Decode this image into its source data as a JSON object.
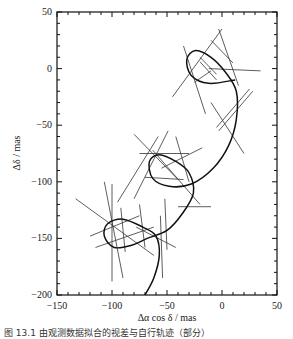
{
  "chart_data": {
    "type": "line",
    "title": "",
    "xlabel": "Δα cos δ / mas",
    "ylabel": "Δδ / mas",
    "xlim": [
      -150,
      50
    ],
    "ylim": [
      -200,
      50
    ],
    "xticks": [
      -150,
      -100,
      -50,
      0,
      50
    ],
    "yticks": [
      50,
      0,
      -50,
      -100,
      -150,
      -200
    ],
    "grid": false,
    "legend": null,
    "series": [
      {
        "name": "astrometric orbit (parallax + proper motion)",
        "style": "curve",
        "points": [
          [
            -70,
            -205
          ],
          [
            -62,
            -185
          ],
          [
            -57,
            -165
          ],
          [
            -60,
            -148
          ],
          [
            -72,
            -140
          ],
          [
            -90,
            -133
          ],
          [
            -104,
            -137
          ],
          [
            -107,
            -148
          ],
          [
            -98,
            -158
          ],
          [
            -82,
            -156
          ],
          [
            -68,
            -150
          ],
          [
            -50,
            -143
          ],
          [
            -36,
            -128
          ],
          [
            -26,
            -110
          ],
          [
            -30,
            -92
          ],
          [
            -42,
            -82
          ],
          [
            -57,
            -76
          ],
          [
            -66,
            -82
          ],
          [
            -63,
            -97
          ],
          [
            -48,
            -104
          ],
          [
            -28,
            -102
          ],
          [
            -8,
            -88
          ],
          [
            6,
            -68
          ],
          [
            13,
            -45
          ],
          [
            13,
            -20
          ],
          [
            3,
            -3
          ],
          [
            -10,
            10
          ],
          [
            -24,
            16
          ],
          [
            -32,
            8
          ],
          [
            -28,
            -6
          ],
          [
            -12,
            -13
          ],
          [
            12,
            -10
          ]
        ]
      }
    ],
    "observation_lines": [
      [
        [
          -107,
          -100
        ],
        [
          -90,
          -185
        ]
      ],
      [
        [
          -100,
          -102
        ],
        [
          -100,
          -188
        ]
      ],
      [
        [
          -120,
          -148
        ],
        [
          -75,
          -130
        ]
      ],
      [
        [
          -115,
          -158
        ],
        [
          -62,
          -140
        ]
      ],
      [
        [
          -133,
          -115
        ],
        [
          -62,
          -165
        ]
      ],
      [
        [
          -92,
          -123
        ],
        [
          -88,
          -162
        ]
      ],
      [
        [
          -75,
          -120
        ],
        [
          -70,
          -158
        ]
      ],
      [
        [
          -78,
          -140
        ],
        [
          -42,
          -158
        ]
      ],
      [
        [
          -56,
          -130
        ],
        [
          -54,
          -185
        ]
      ],
      [
        [
          -40,
          -122
        ],
        [
          -10,
          -122
        ]
      ],
      [
        [
          -52,
          -115
        ],
        [
          -50,
          -160
        ]
      ],
      [
        [
          -58,
          -60
        ],
        [
          -95,
          -118
        ]
      ],
      [
        [
          -49,
          -55
        ],
        [
          -80,
          -115
        ]
      ],
      [
        [
          -75,
          -75
        ],
        [
          -30,
          -75
        ]
      ],
      [
        [
          -70,
          -96
        ],
        [
          -35,
          -98
        ]
      ],
      [
        [
          -80,
          -58
        ],
        [
          -40,
          -98
        ]
      ],
      [
        [
          -63,
          -72
        ],
        [
          -20,
          -120
        ]
      ],
      [
        [
          -55,
          -88
        ],
        [
          -18,
          -70
        ]
      ],
      [
        [
          -42,
          -60
        ],
        [
          -30,
          -100
        ]
      ],
      [
        [
          -35,
          20
        ],
        [
          -15,
          -40
        ]
      ],
      [
        [
          -25,
          -12
        ],
        [
          -10,
          -2
        ]
      ],
      [
        [
          -20,
          10
        ],
        [
          -5,
          -5
        ]
      ],
      [
        [
          -45,
          -25
        ],
        [
          0,
          35
        ]
      ],
      [
        [
          -3,
          35
        ],
        [
          15,
          -15
        ]
      ],
      [
        [
          -10,
          25
        ],
        [
          10,
          5
        ]
      ],
      [
        [
          -20,
          6
        ],
        [
          -5,
          -10
        ]
      ],
      [
        [
          -12,
          0
        ],
        [
          35,
          -2
        ]
      ],
      [
        [
          -5,
          -52
        ],
        [
          25,
          -18
        ]
      ],
      [
        [
          -3,
          -55
        ],
        [
          28,
          -20
        ]
      ],
      [
        [
          -10,
          -30
        ],
        [
          20,
          -75
        ]
      ]
    ]
  },
  "axes": {
    "x_tick_labels": [
      "−150",
      "−100",
      "−50",
      "0",
      "50"
    ],
    "y_tick_labels": [
      "50",
      "0",
      "−50",
      "−100",
      "−150",
      "−200"
    ],
    "xlabel": "Δα cos δ / mas",
    "ylabel": "Δδ / mas"
  },
  "caption": "图 13.1  由观测数据拟合的视差与自行轨迹（部分）"
}
